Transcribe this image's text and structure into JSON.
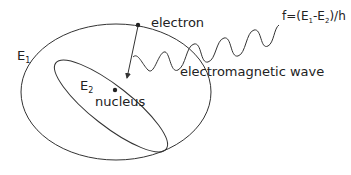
{
  "diagram": {
    "labels": {
      "electron": "electron",
      "nucleus": "nucleus",
      "outer_level": "E",
      "outer_level_sub": "1",
      "inner_level": "E",
      "inner_level_sub": "2",
      "wave": "electromagnetic wave",
      "formula_prefix": "f=(E",
      "formula_sub1": "1",
      "formula_mid": "-E",
      "formula_sub2": "2",
      "formula_suffix": ")/h"
    },
    "colors": {
      "stroke": "#333333",
      "text": "#222222",
      "background": "#ffffff"
    }
  }
}
